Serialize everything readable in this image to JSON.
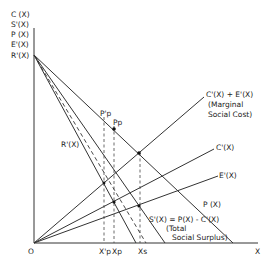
{
  "y_axis_labels": [
    "C (X)",
    "S'(X)",
    "P (X)",
    "E'(X)",
    "R'(X)"
  ],
  "x_axis_label": "X",
  "origin_label": "O",
  "x_ticks": {
    "xp_prime": "X'p",
    "xp": "Xp",
    "xs": "Xs"
  },
  "curves": {
    "mc_total": {
      "line1": "C'(X) + E'(X)",
      "line2": "(Marginal",
      "line3": "Social Cost)"
    },
    "c_prime": "C'(X)",
    "e_prime": "E'(X)",
    "p": "P (X)",
    "r_prime": "R'(X)",
    "s_prime": {
      "line1": "S'(X) = P(X) - C'(X)",
      "line2": "(Total",
      "line3": "Social Surplus)"
    }
  },
  "points": {
    "pp_prime": "P'p",
    "pp": "Pp"
  },
  "colors": {
    "ink": "#333333",
    "background": "#ffffff"
  }
}
